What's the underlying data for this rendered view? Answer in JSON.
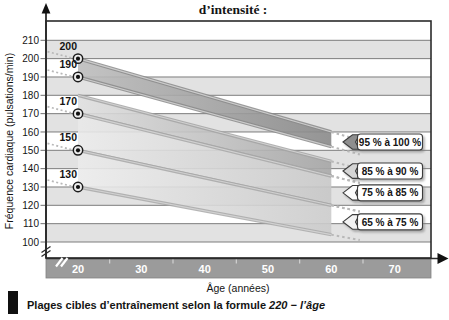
{
  "title": "d’intensité :",
  "caption": {
    "text": "Plages cibles d’entraînement selon la formule",
    "formula": "220 − l’âge"
  },
  "chart_data": {
    "type": "area",
    "title": "d’intensité :",
    "xlabel": "Âge (années)",
    "ylabel": "Fréquence cardiaque (pulsations/min)",
    "xlim": [
      20,
      70
    ],
    "ylim": [
      100,
      210
    ],
    "axis_break_below_y": 100,
    "x_ticks": [
      20,
      30,
      40,
      50,
      60,
      70
    ],
    "x_minor_ticks": [
      25,
      35,
      45,
      55,
      65
    ],
    "y_ticks": [
      210,
      200,
      190,
      180,
      170,
      160,
      150,
      140,
      130,
      120,
      110,
      100
    ],
    "formula": "220 − l’âge",
    "markers": [
      {
        "age": 20,
        "bpm": 200,
        "label": "200"
      },
      {
        "age": 20,
        "bpm": 190,
        "label": "190"
      },
      {
        "age": 20,
        "bpm": 170,
        "label": "170"
      },
      {
        "age": 20,
        "bpm": 150,
        "label": "150"
      },
      {
        "age": 20,
        "bpm": 130,
        "label": "130"
      }
    ],
    "band_age_range": [
      20,
      60
    ],
    "bands": [
      {
        "label": "95 % à 100 %",
        "pct_low": 0.95,
        "pct_high": 1.0,
        "bpm_at_20": [
          190,
          200
        ],
        "bpm_at_60": [
          152,
          160
        ],
        "fill_from": "#bdbdbd",
        "fill_to": "#898989",
        "edge": "#8a8a8a",
        "arrow_fill": "#8e8e8e"
      },
      {
        "label": "85 % à 90 %",
        "pct_low": 0.85,
        "pct_high": 0.9,
        "bpm_at_20": [
          170,
          180
        ],
        "bpm_at_60": [
          136,
          144
        ],
        "fill_from": "#dedede",
        "fill_to": "#a6a6a6",
        "edge": "#a3a3a3",
        "arrow_fill": "#d4d4d4"
      },
      {
        "label": "75 % à 85 %",
        "pct_low": 0.75,
        "pct_high": 0.85,
        "bpm_at_20": [
          150,
          170
        ],
        "bpm_at_60": [
          120,
          136
        ],
        "fill_from": "#e9e9e9",
        "fill_to": "#c7c7c7",
        "edge": "#a8a8a8",
        "arrow_fill": "#fbfbfb"
      },
      {
        "label": "65 % à 75 %",
        "pct_low": 0.65,
        "pct_high": 0.75,
        "bpm_at_20": [
          130,
          150
        ],
        "bpm_at_60": [
          104,
          120
        ],
        "fill_from": "#ebebeb",
        "fill_to": "#cbcbcb",
        "edge": "#a8a8a8",
        "arrow_fill": "#f3f3f3"
      }
    ],
    "colors": {
      "row_shade": "#e2e2e2",
      "grid": "#6f6f6f",
      "frame": "#2b2b2b",
      "age_band": "#9b9b9b",
      "age_band_border": "#828282",
      "dotted": "#b8b8b8",
      "callout_bg": "#ffffff",
      "callout_border": "#3c3c3c",
      "text": "#141414",
      "axis_label_white": "#ffffff",
      "marker_ring": "#1c1c1c",
      "minor_tick": "#d2d2d2"
    },
    "legend_position": "right",
    "grid": true
  }
}
